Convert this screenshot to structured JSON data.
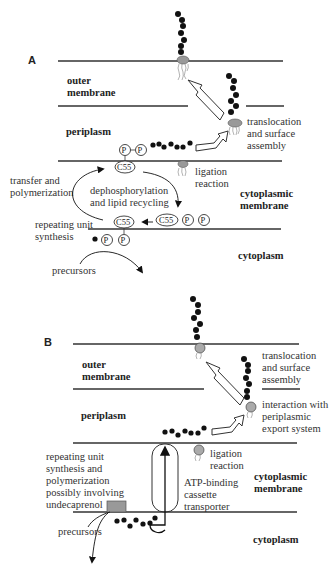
{
  "panelA": {
    "label": "A",
    "compartments": {
      "outer_membrane_1": "outer",
      "outer_membrane_2": "membrane",
      "periplasm": "periplasm",
      "cytoplasmic_membrane_1": "cytoplasmic",
      "cytoplasmic_membrane_2": "membrane",
      "cytoplasm": "cytoplasm"
    },
    "annotations": {
      "translocation_1": "translocation",
      "translocation_2": "and surface",
      "translocation_3": "assembly",
      "ligation_1": "ligation",
      "ligation_2": "reaction",
      "transfer_1": "transfer and",
      "transfer_2": "polymerization",
      "dephos_1": "dephosphorylation",
      "dephos_2": "and lipid recycling",
      "repeating_1": "repeating unit",
      "repeating_2": "synthesis",
      "precursors": "precursors"
    },
    "symbols": {
      "phosphate": "P",
      "lipid": "C55"
    }
  },
  "panelB": {
    "label": "B",
    "compartments": {
      "outer_membrane_1": "outer",
      "outer_membrane_2": "membrane",
      "periplasm": "periplasm",
      "cytoplasmic_membrane_1": "cytoplasmic",
      "cytoplasmic_membrane_2": "membrane",
      "cytoplasm": "cytoplasm"
    },
    "annotations": {
      "translocation_1": "translocation",
      "translocation_2": "and surface",
      "translocation_3": "assembly",
      "interaction_1": "interaction  with",
      "interaction_2": "periplasmic",
      "interaction_3": "export system",
      "ligation_1": "ligation",
      "ligation_2": "reaction",
      "repeating_1": "repeating unit",
      "repeating_2": "synthesis and",
      "repeating_3": "polymerization",
      "repeating_4": "possibly involving",
      "repeating_5": "undecaprenol",
      "abc_1": "ATP-binding",
      "abc_2": "cassette",
      "abc_3": "transporter",
      "precursors": "precursors"
    }
  }
}
